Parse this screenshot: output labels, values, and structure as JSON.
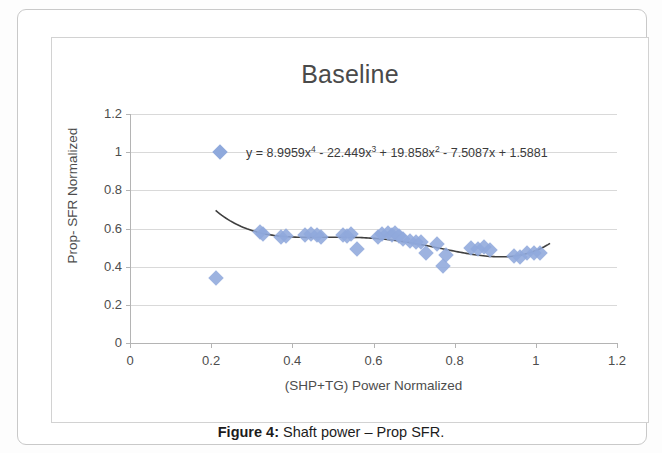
{
  "caption": {
    "prefix": "Figure 4:",
    "text": " Shaft power – Prop SFR."
  },
  "colors": {
    "marker": "#8fa9dc",
    "trendline": "#3f3f3f",
    "gridline": "#d9d9d9",
    "axis": "#b4b4b4"
  },
  "chart_data": {
    "type": "scatter",
    "title": "Baseline",
    "xlabel": "(SHP+TG) Power Normalized",
    "ylabel": "Prop- SFR Normalized",
    "xlim": [
      0,
      1.2
    ],
    "ylim": [
      0,
      1.2
    ],
    "xticks": [
      "0",
      "0.2",
      "0.4",
      "0.6",
      "0.8",
      "1",
      "1.2"
    ],
    "xtick_values": [
      0,
      0.2,
      0.4,
      0.6,
      0.8,
      1.0,
      1.2
    ],
    "yticks": [
      "0",
      "0.2",
      "0.4",
      "0.6",
      "0.8",
      "1",
      "1.2"
    ],
    "ytick_values": [
      0,
      0.2,
      0.4,
      0.6,
      0.8,
      1.0,
      1.2
    ],
    "grid": "horizontal",
    "legend": "none",
    "annotation": {
      "equation_text": "y = 8.9959x⁴ - 22.449x³ + 19.858x² - 7.5087x + 1.5881",
      "equation_parts": [
        "y = 8.9959x",
        "4",
        " - 22.449x",
        "3",
        " + 19.858x",
        "2",
        " - 7.5087x  + 1.5881"
      ],
      "marker_x": 0.222,
      "marker_y": 1.0
    },
    "series": [
      {
        "name": "Prop-SFR Normalized",
        "marker": "diamond",
        "points": [
          [
            0.211,
            0.341
          ],
          [
            0.32,
            0.58
          ],
          [
            0.327,
            0.573
          ],
          [
            0.372,
            0.558
          ],
          [
            0.384,
            0.562
          ],
          [
            0.432,
            0.567
          ],
          [
            0.447,
            0.57
          ],
          [
            0.46,
            0.566
          ],
          [
            0.47,
            0.558
          ],
          [
            0.525,
            0.568
          ],
          [
            0.535,
            0.562
          ],
          [
            0.545,
            0.571
          ],
          [
            0.56,
            0.49
          ],
          [
            0.61,
            0.553
          ],
          [
            0.622,
            0.572
          ],
          [
            0.635,
            0.578
          ],
          [
            0.645,
            0.568
          ],
          [
            0.652,
            0.575
          ],
          [
            0.663,
            0.56
          ],
          [
            0.672,
            0.545
          ],
          [
            0.69,
            0.535
          ],
          [
            0.705,
            0.527
          ],
          [
            0.718,
            0.53
          ],
          [
            0.73,
            0.47
          ],
          [
            0.757,
            0.52
          ],
          [
            0.772,
            0.402
          ],
          [
            0.778,
            0.462
          ],
          [
            0.84,
            0.5
          ],
          [
            0.858,
            0.492
          ],
          [
            0.872,
            0.503
          ],
          [
            0.888,
            0.488
          ],
          [
            0.945,
            0.458
          ],
          [
            0.962,
            0.452
          ],
          [
            0.978,
            0.47
          ],
          [
            0.995,
            0.47
          ],
          [
            1.01,
            0.472
          ]
        ]
      }
    ],
    "trendline": {
      "type": "polynomial",
      "degree": 4,
      "coefficients": [
        8.9959,
        -22.449,
        19.858,
        -7.5087,
        1.5881
      ],
      "x_start": 0.211,
      "x_end": 1.035
    }
  }
}
